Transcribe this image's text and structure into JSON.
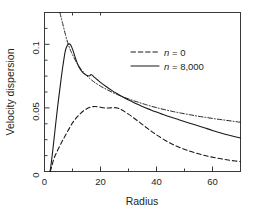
{
  "chart_data": {
    "type": "line",
    "title": "",
    "xlabel": "Radius",
    "ylabel": "Velocity dispersion",
    "xlim": [
      0,
      70
    ],
    "ylim": [
      0,
      0.125
    ],
    "xticks": [
      0,
      20,
      40,
      60
    ],
    "xtick_labels": [
      "0",
      "20",
      "40",
      "60"
    ],
    "xminorticks": [
      10,
      30,
      50,
      70
    ],
    "yticks": [
      0,
      0.05,
      0.1
    ],
    "ytick_labels": [
      "0",
      "0.05",
      "0.1"
    ],
    "yminorticks": [
      0.0125,
      0.025,
      0.0375,
      0.0625,
      0.075,
      0.0875,
      0.1125,
      0.125
    ],
    "grid": false,
    "legend_position": "upper right",
    "series": [
      {
        "name": "n = 0",
        "label_prefix": "n",
        "label_value": "0",
        "style": "dashed",
        "color": "#1a1a1a",
        "x": [
          2.0,
          2.6,
          3.2,
          4.0,
          5.0,
          6.0,
          7.0,
          8.0,
          9.0,
          10.0,
          11.0,
          12.0,
          13.0,
          14.0,
          15.0,
          16.0,
          17.0,
          18.0,
          19.0,
          20.0,
          21.0,
          22.0,
          23.0,
          24.0,
          25.0,
          26.0,
          27.0,
          28.0,
          30.0,
          32.0,
          34.0,
          36.0,
          38.0,
          40.0,
          43.0,
          46.0,
          49.0,
          52.0,
          55.0,
          58.0,
          61.0,
          64.0,
          67.0,
          70.0
        ],
        "y": [
          0.0,
          0.004,
          0.009,
          0.0135,
          0.018,
          0.0225,
          0.0265,
          0.0305,
          0.0345,
          0.0382,
          0.0412,
          0.0437,
          0.0459,
          0.0478,
          0.0492,
          0.0503,
          0.0509,
          0.0511,
          0.0509,
          0.0505,
          0.0501,
          0.0499,
          0.0499,
          0.0501,
          0.0502,
          0.0499,
          0.0491,
          0.0479,
          0.0451,
          0.0419,
          0.0386,
          0.0352,
          0.0319,
          0.0288,
          0.0246,
          0.0211,
          0.0183,
          0.0159,
          0.0139,
          0.0122,
          0.0108,
          0.0096,
          0.0086,
          0.0078
        ]
      },
      {
        "name": "n = 8,000",
        "label_prefix": "n",
        "label_value": "8,000",
        "style": "solid",
        "color": "#1a1a1a",
        "x": [
          2.0,
          2.4,
          3.0,
          3.6,
          4.2,
          5.0,
          5.8,
          6.6,
          7.4,
          8.0,
          8.6,
          9.0,
          9.4,
          10.0,
          10.6,
          11.2,
          12.0,
          13.0,
          14.0,
          15.0,
          16.0,
          16.6,
          17.0,
          18.0,
          19.0,
          20.0,
          22.0,
          24.0,
          26.0,
          28.0,
          30.0,
          32.0,
          34.0,
          36.0,
          38.0,
          40.0,
          42.0,
          45.0,
          48.0,
          51.0,
          54.0,
          57.0,
          60.0,
          63.0,
          66.0,
          70.0
        ],
        "y": [
          0.0,
          0.0065,
          0.0175,
          0.0295,
          0.0415,
          0.0565,
          0.0705,
          0.0835,
          0.0945,
          0.0985,
          0.1002,
          0.1002,
          0.0992,
          0.0962,
          0.0922,
          0.0882,
          0.0836,
          0.0796,
          0.0771,
          0.0757,
          0.0751,
          0.0762,
          0.0758,
          0.0738,
          0.0719,
          0.0701,
          0.0668,
          0.0638,
          0.0611,
          0.0586,
          0.0563,
          0.0541,
          0.0521,
          0.0502,
          0.0484,
          0.0467,
          0.0451,
          0.0428,
          0.0407,
          0.0386,
          0.0365,
          0.0344,
          0.0323,
          0.0303,
          0.0285,
          0.0263
        ]
      },
      {
        "name": "reference",
        "style": "dash-dot",
        "color": "#1a1a1a",
        "x": [
          5.5,
          6.0,
          6.5,
          7.0,
          7.5,
          8.0,
          8.5,
          9.0,
          9.5,
          10.0,
          11.0,
          12.0,
          13.0,
          14.0,
          15.0,
          16.0,
          17.0,
          18.0,
          20.0,
          22.0,
          24.0,
          26.0,
          28.0,
          30.0,
          32.0,
          34.0,
          36.0,
          38.0,
          40.0,
          43.0,
          46.0,
          49.0,
          52.0,
          55.0,
          58.0,
          61.0,
          64.0,
          67.0,
          70.0
        ],
        "y": [
          0.125,
          0.1205,
          0.1162,
          0.1118,
          0.1075,
          0.1035,
          0.0998,
          0.0968,
          0.0942,
          0.0918,
          0.0875,
          0.0838,
          0.0806,
          0.0779,
          0.0755,
          0.0734,
          0.0716,
          0.0699,
          0.0671,
          0.0647,
          0.0625,
          0.0605,
          0.0587,
          0.0571,
          0.0555,
          0.0541,
          0.0527,
          0.0514,
          0.0502,
          0.0486,
          0.0471,
          0.0458,
          0.0446,
          0.0434,
          0.0424,
          0.0414,
          0.0405,
          0.0396,
          0.0387
        ]
      }
    ],
    "legend": [
      {
        "style": "dashed",
        "prefix": "n",
        "eq": " = ",
        "value": "0"
      },
      {
        "style": "solid",
        "prefix": "n",
        "eq": " = ",
        "value": "8,000"
      }
    ]
  }
}
